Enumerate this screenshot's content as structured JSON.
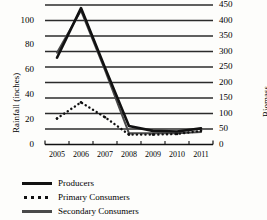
{
  "chart_data": {
    "type": "line",
    "title": "",
    "xlabel": "",
    "ylabel": "Rainfall (inches)",
    "ylabel_right": "Biomass",
    "grid": true,
    "legend_position": "bottom-left",
    "x": [
      "2005",
      "2006",
      "2007",
      "2008",
      "2009",
      "2010",
      "2011"
    ],
    "ylim": [
      0,
      116
    ],
    "yticks": [
      "0",
      "20",
      "40",
      "60",
      "80",
      "100"
    ],
    "ytick_values": [
      0,
      20,
      40,
      60,
      80,
      100
    ],
    "ylim_right": [
      0,
      520
    ],
    "yticks_right": [
      "0",
      "50",
      "100",
      "150",
      "200",
      "250",
      "300",
      "350",
      "400",
      "450"
    ],
    "ytick_values_right": [
      0,
      50,
      100,
      150,
      200,
      250,
      300,
      350,
      400,
      450
    ],
    "series": [
      {
        "name": "Producers",
        "style": "solid-thick",
        "color": "#111111",
        "axis": "left",
        "values": [
          70,
          110,
          62,
          15,
          11,
          10.5,
          13
        ]
      },
      {
        "name": "Primary Consumers",
        "style": "dotted",
        "color": "#111111",
        "axis": "left",
        "values": [
          21,
          34,
          22,
          8,
          8,
          8.5,
          11
        ]
      },
      {
        "name": "Secondary Consumers",
        "style": "solid-medium",
        "color": "#4a4a4a",
        "axis": "left",
        "values": [
          74,
          108,
          60,
          9,
          9,
          9,
          10
        ]
      }
    ]
  },
  "legend": {
    "items": [
      {
        "label": "Producers",
        "swatch": "sw-solid-thick"
      },
      {
        "label": "Primary Consumers",
        "swatch": "sw-dotted"
      },
      {
        "label": "Secondary Consumers",
        "swatch": "sw-solid-gray"
      }
    ]
  }
}
